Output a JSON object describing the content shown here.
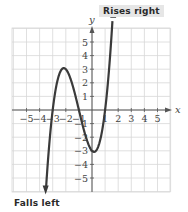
{
  "chart_data": {
    "type": "line",
    "title": "",
    "xlabel": "x",
    "ylabel": "y",
    "xlim": [
      -6,
      6
    ],
    "ylim": [
      -6,
      6
    ],
    "grid": true,
    "x_ticks": [
      -5,
      -4,
      -3,
      -2,
      -1,
      1,
      2,
      3,
      4,
      5
    ],
    "y_ticks": [
      5,
      4,
      3,
      2,
      1,
      -1,
      -2,
      -3,
      -4,
      -5
    ],
    "x_tick_labels": [
      "−5",
      "−4",
      "−3",
      "−2",
      "−1",
      "1",
      "2",
      "3",
      "4",
      "5"
    ],
    "y_tick_labels": [
      "5",
      "4",
      "3",
      "2",
      "1",
      "−1",
      "−2",
      "−3",
      "−4",
      "−5"
    ],
    "series": [
      {
        "name": "f(x) = (x+3)(x+1)(x−1)",
        "x": [
          -3.55,
          -3,
          -2.5,
          -2,
          -1.5,
          -1,
          -0.5,
          0,
          0.5,
          1,
          1.3,
          1.62
        ],
        "y": [
          -5.9,
          0,
          2.625,
          3,
          1.875,
          0,
          -1.875,
          -3,
          -2.625,
          0,
          3.1,
          5.8
        ]
      }
    ],
    "key_points": {
      "x_intercepts": [
        -3,
        -1,
        1
      ],
      "local_max": [
        -2,
        3
      ],
      "local_min": [
        0,
        -3
      ]
    },
    "annotations": [
      {
        "text": "Rises right",
        "position": "top right of curve"
      },
      {
        "text": "Falls left",
        "position": "bottom left of curve"
      }
    ]
  },
  "labels": {
    "rises": "Rises right",
    "falls": "Falls left",
    "x_axis": "x",
    "y_axis": "y"
  },
  "colors": {
    "curve": "#3a3a3a",
    "grid": "#d8d8d8",
    "axis": "#555555",
    "label_bg": "#e6e6e6"
  }
}
